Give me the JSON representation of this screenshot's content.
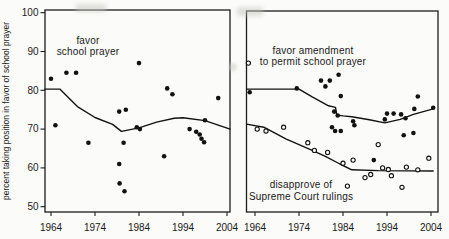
{
  "figure": {
    "ylabel": "percent taking position in favor of school prayer"
  },
  "chart_data": {
    "type": "scatter",
    "ylabel": "percent taking position in favor of school prayer",
    "x_range": [
      1962.5,
      2005.5
    ],
    "y_range": [
      48.5,
      101
    ],
    "grid": false,
    "panels": [
      {
        "name": "left",
        "x_ticks": [
          "1964",
          "1974",
          "1984",
          "1994",
          "2004"
        ],
        "y_ticks": [
          "50",
          "60",
          "70",
          "80",
          "90",
          "100"
        ],
        "series": [
          {
            "label_lines": [
              "favor",
              "school prayer"
            ],
            "marker": "filled",
            "points": [
              [
                1964,
                83
              ],
              [
                1965,
                71
              ],
              [
                1967.5,
                84.5
              ],
              [
                1969.7,
                84.5
              ],
              [
                1972.5,
                66.5
              ],
              [
                1979.5,
                74.5
              ],
              [
                1981,
                75
              ],
              [
                1980.5,
                66.5
              ],
              [
                1979.5,
                61
              ],
              [
                1979.6,
                56
              ],
              [
                1980.7,
                54
              ],
              [
                1983.5,
                70.5
              ],
              [
                1984.2,
                70
              ],
              [
                1984,
                87
              ],
              [
                1990.4,
                80.5
              ],
              [
                1991.6,
                79
              ],
              [
                1989.7,
                63
              ],
              [
                1995.5,
                70
              ],
              [
                1997,
                69.3
              ],
              [
                1997.8,
                68.6
              ],
              [
                1998.2,
                67.5
              ],
              [
                1998.8,
                66.6
              ],
              [
                1999,
                72.3
              ],
              [
                2002,
                78
              ]
            ],
            "trend": [
              [
                1962.6,
                80.3
              ],
              [
                1966,
                80.3
              ],
              [
                1970,
                75.8
              ],
              [
                1974,
                73
              ],
              [
                1978,
                71.2
              ],
              [
                1980,
                69.4
              ],
              [
                1984,
                70.3
              ],
              [
                1988,
                71.8
              ],
              [
                1992,
                72.8
              ],
              [
                1994,
                72.9
              ],
              [
                1999,
                72.2
              ],
              [
                2002,
                71
              ],
              [
                2004.7,
                70
              ]
            ]
          }
        ]
      },
      {
        "name": "right",
        "x_ticks": [
          "1964",
          "1974",
          "1984",
          "1994",
          "2004"
        ],
        "y_ticks": [],
        "series": [
          {
            "label_lines": [
              "favor amendment",
              "to permit school prayer"
            ],
            "marker": "filled",
            "points": [
              [
                1962.8,
                79.5
              ],
              [
                1973.5,
                80.5
              ],
              [
                1979,
                82.5
              ],
              [
                1980,
                81
              ],
              [
                1981,
                82.5
              ],
              [
                1983,
                84
              ],
              [
                1983.5,
                78.5
              ],
              [
                1982,
                74.5
              ],
              [
                1982.8,
                73.5
              ],
              [
                1981.5,
                70.5
              ],
              [
                1982.2,
                69.5
              ],
              [
                1983.5,
                69.5
              ],
              [
                1986.3,
                72
              ],
              [
                1986.6,
                71
              ],
              [
                1991,
                62
              ],
              [
                1993.5,
                72.5
              ],
              [
                1994,
                74
              ],
              [
                1995.5,
                74
              ],
              [
                1997.2,
                73.8
              ],
              [
                1998.2,
                72.8
              ],
              [
                1997.8,
                68.4
              ],
              [
                2000,
                69
              ],
              [
                2000.2,
                75.2
              ],
              [
                2001,
                78.4
              ],
              [
                2004.5,
                75.5
              ]
            ],
            "trend": [
              [
                1962.1,
                80.3
              ],
              [
                1974,
                80.3
              ],
              [
                1977,
                78.3
              ],
              [
                1980.7,
                76
              ],
              [
                1982.3,
                75.6
              ],
              [
                1982.6,
                73.6
              ],
              [
                1984,
                73.4
              ],
              [
                1986,
                73.2
              ],
              [
                1990,
                72.4
              ],
              [
                1993.5,
                71.6
              ],
              [
                1997,
                72.5
              ],
              [
                2000,
                73.8
              ],
              [
                2004.5,
                75.2
              ]
            ]
          },
          {
            "label_lines": [
              "disapprove of",
              "Supreme Court rulings"
            ],
            "marker": "open",
            "points": [
              [
                1962.5,
                87
              ],
              [
                1964.5,
                70
              ],
              [
                1966.5,
                69.5
              ],
              [
                1970.5,
                70.5
              ],
              [
                1976,
                66.5
              ],
              [
                1977.5,
                64.5
              ],
              [
                1980.5,
                64
              ],
              [
                1984,
                61.2
              ],
              [
                1985,
                55.3
              ],
              [
                1986.3,
                62
              ],
              [
                1989,
                57.5
              ],
              [
                1990.3,
                58.3
              ],
              [
                1992,
                66
              ],
              [
                1993,
                60
              ],
              [
                1994.3,
                59.6
              ],
              [
                1995,
                58
              ],
              [
                1997.4,
                55
              ],
              [
                1998.4,
                60.2
              ],
              [
                2001,
                59.5
              ],
              [
                2003.5,
                62.5
              ]
            ],
            "trend": [
              [
                1962.1,
                71.3
              ],
              [
                1966,
                70.5
              ],
              [
                1971,
                67.5
              ],
              [
                1977,
                64.5
              ],
              [
                1980,
                63
              ],
              [
                1983.3,
                61
              ],
              [
                1986,
                59.5
              ],
              [
                1992,
                59.3
              ],
              [
                2004.5,
                59.2
              ]
            ]
          }
        ]
      }
    ]
  }
}
